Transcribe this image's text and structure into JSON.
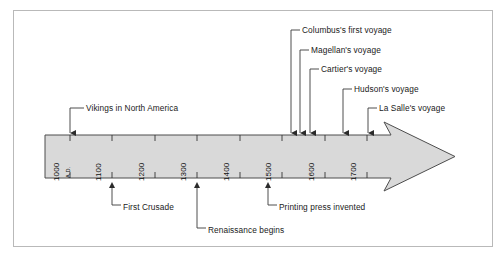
{
  "figure": {
    "kind": "timeline-diagram",
    "orientation": "horizontal-arrow-right",
    "colors": {
      "frame_border": "#b9b9b9",
      "bar_fill": "#d9d9d9",
      "bar_stroke": "#4d4d4d",
      "text": "#1a1a1a",
      "leader_line": "#3a3a3a",
      "background": "#ffffff"
    }
  },
  "axis": {
    "era_label": "A.D.",
    "ticks": [
      {
        "label": "1000",
        "value": 1000,
        "x": 70
      },
      {
        "label": "1100",
        "value": 1100,
        "x": 112
      },
      {
        "label": "1200",
        "value": 1200,
        "x": 155
      },
      {
        "label": "1300",
        "value": 1300,
        "x": 197
      },
      {
        "label": "1400",
        "value": 1400,
        "x": 240
      },
      {
        "label": "1500",
        "value": 1500,
        "x": 282
      },
      {
        "label": "1600",
        "value": 1600,
        "x": 325
      },
      {
        "label": "1700",
        "value": 1700,
        "x": 367
      }
    ]
  },
  "events_above": [
    {
      "label": "Vikings in North America",
      "marker_x": 70,
      "text_x": 84,
      "text_y": 104,
      "elbow_x": 78,
      "line_top": 108
    },
    {
      "label": "Columbus's first voyage",
      "marker_x": 291,
      "text_x": 300,
      "text_y": 26,
      "elbow_x": 295,
      "line_top": 30
    },
    {
      "label": "Magellan's voyage",
      "marker_x": 300,
      "text_x": 309,
      "text_y": 46,
      "elbow_x": 304,
      "line_top": 50
    },
    {
      "label": "Cartier's voyage",
      "marker_x": 310,
      "text_x": 319,
      "text_y": 65,
      "elbow_x": 314,
      "line_top": 69
    },
    {
      "label": "Hudson's voyage",
      "marker_x": 343,
      "text_x": 352,
      "text_y": 85,
      "elbow_x": 347,
      "line_top": 89
    },
    {
      "label": "La Salle's voyage",
      "marker_x": 368,
      "text_x": 377,
      "text_y": 104,
      "elbow_x": 372,
      "line_top": 108
    }
  ],
  "events_below": [
    {
      "label": "First Crusade",
      "marker_x": 112,
      "text_x": 121,
      "text_y": 208,
      "elbow_x": 117,
      "line_bottom": 205
    },
    {
      "label": "Renaissance begins",
      "marker_x": 197,
      "text_x": 206,
      "text_y": 231,
      "elbow_x": 202,
      "line_bottom": 228
    },
    {
      "label": "Printing press invented",
      "marker_x": 268,
      "text_x": 277,
      "text_y": 208,
      "elbow_x": 272,
      "line_bottom": 205
    }
  ]
}
